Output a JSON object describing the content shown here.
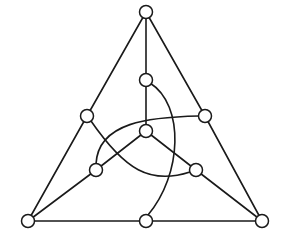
{
  "diagram": {
    "title": "",
    "type": "fano-plane",
    "colors": {
      "stroke": "#1a1a1a",
      "node_fill": "#ffffff",
      "background": "#ffffff"
    },
    "node_radius": 6.5,
    "nodes": [
      {
        "id": "top",
        "x": 146,
        "y": 12
      },
      {
        "id": "bottom-left",
        "x": 28,
        "y": 221
      },
      {
        "id": "bottom-right",
        "x": 262,
        "y": 221
      },
      {
        "id": "left-mid",
        "x": 87,
        "y": 116
      },
      {
        "id": "right-mid",
        "x": 205,
        "y": 116
      },
      {
        "id": "bottom-mid",
        "x": 146,
        "y": 221
      },
      {
        "id": "upper-center",
        "x": 146,
        "y": 80
      },
      {
        "id": "center",
        "x": 146,
        "y": 131
      },
      {
        "id": "inner-left",
        "x": 96,
        "y": 170
      },
      {
        "id": "inner-right",
        "x": 196,
        "y": 170
      }
    ],
    "straight_edges": [
      {
        "from": "top",
        "to": "left-mid"
      },
      {
        "from": "left-mid",
        "to": "bottom-left"
      },
      {
        "from": "top",
        "to": "right-mid"
      },
      {
        "from": "right-mid",
        "to": "bottom-right"
      },
      {
        "from": "bottom-left",
        "to": "bottom-mid"
      },
      {
        "from": "bottom-mid",
        "to": "bottom-right"
      },
      {
        "from": "top",
        "to": "upper-center"
      },
      {
        "from": "upper-center",
        "to": "center"
      },
      {
        "from": "center",
        "to": "inner-left"
      },
      {
        "from": "inner-left",
        "to": "bottom-left"
      },
      {
        "from": "center",
        "to": "inner-right"
      },
      {
        "from": "inner-right",
        "to": "bottom-right"
      }
    ],
    "curved_edges": [
      {
        "from": "upper-center",
        "to": "bottom-mid",
        "path": "M 150 83 C 185 105, 182 175, 148 215"
      },
      {
        "from": "right-mid",
        "to": "inner-left",
        "path": "M 199 116 C 150 117, 98 122, 96 164"
      },
      {
        "from": "left-mid",
        "to": "inner-right",
        "path": "M 91 121 C 125 170, 150 185, 190 172"
      }
    ]
  }
}
